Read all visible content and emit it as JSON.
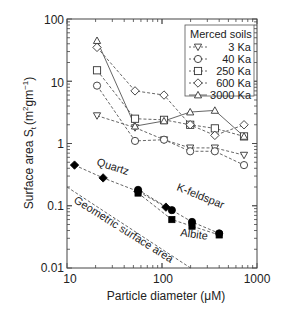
{
  "chart_data": {
    "type": "scatter",
    "title": "",
    "xlabel": "Particle diameter (μM)",
    "ylabel": "Surface area S_t (m²gm⁻¹)",
    "xscale": "log",
    "yscale": "log",
    "xlim": [
      10,
      1000
    ],
    "ylim": [
      0.01,
      100
    ],
    "xticks": [
      "10",
      "100",
      "1000"
    ],
    "yticks": [
      "0.01",
      "0.1",
      "1",
      "10",
      "100"
    ],
    "grid": false,
    "legend": {
      "title": "Merced soils",
      "position": "upper right",
      "entries": [
        "3 Ka",
        "40 Ka",
        "250 Ka",
        "600 Ka",
        "3000 Ka"
      ]
    },
    "series": [
      {
        "name": "3 Ka",
        "marker": "triangle-down",
        "line": "dashed",
        "x": [
          20.7,
          52,
          105,
          198,
          360,
          730
        ],
        "y": [
          2.8,
          1.8,
          1.15,
          0.85,
          0.85,
          0.65
        ]
      },
      {
        "name": "40 Ka",
        "marker": "circle",
        "line": "dashed",
        "x": [
          20.7,
          52,
          105,
          198,
          360,
          730
        ],
        "y": [
          8.5,
          1.1,
          1.15,
          0.75,
          0.75,
          0.45
        ]
      },
      {
        "name": "250 Ka",
        "marker": "square",
        "line": "dashed",
        "x": [
          20.7,
          52,
          105,
          198,
          360,
          730
        ],
        "y": [
          15,
          2.5,
          2.4,
          2.0,
          1.75,
          1.3
        ]
      },
      {
        "name": "600 Ka",
        "marker": "diamond",
        "line": "dashed",
        "x": [
          20.7,
          52,
          105,
          198,
          360,
          730
        ],
        "y": [
          35,
          7.0,
          6.0,
          2.0,
          1.35,
          2.0
        ]
      },
      {
        "name": "3000 Ka",
        "marker": "triangle-up",
        "line": "solid",
        "x": [
          20.7,
          52,
          105,
          198,
          360,
          730
        ],
        "y": [
          45,
          1.9,
          2.3,
          3.2,
          3.4,
          1.3
        ]
      },
      {
        "name": "Quartz",
        "marker": "filled-diamond",
        "line": "dashed",
        "x": [
          12,
          24,
          56,
          110
        ],
        "y": [
          0.45,
          0.28,
          0.17,
          0.095
        ]
      },
      {
        "name": "K-feldspar",
        "marker": "filled-circle",
        "line": "dashed",
        "x": [
          56,
          127,
          207,
          400
        ],
        "y": [
          0.18,
          0.085,
          0.055,
          0.036
        ]
      },
      {
        "name": "Albite",
        "marker": "filled-square",
        "line": "dashed",
        "x": [
          56,
          127,
          207,
          400
        ],
        "y": [
          0.16,
          0.06,
          0.047,
          0.034
        ]
      },
      {
        "name": "Geometric surface area",
        "marker": "none",
        "line": "dashed",
        "x": [
          10,
          200
        ],
        "y": [
          0.2,
          0.01
        ]
      }
    ],
    "annotations": [
      "Quartz",
      "K-feldspar",
      "Albite",
      "Geometric surface area"
    ]
  },
  "labels": {
    "xlabel": "Particle diameter (μM)",
    "ylabel_main": "Surface area S",
    "ylabel_sub": "t",
    "ylabel_unit": "(m",
    "ylabel_sup2": "2",
    "ylabel_gm": "gm",
    "ylabel_supm1": "−1",
    "ylabel_close": ")",
    "legend_title": "Merced soils",
    "legend_3": "3 Ka",
    "legend_40": "40 Ka",
    "legend_250": "250 Ka",
    "legend_600": "600 Ka",
    "legend_3000": "3000 Ka",
    "quartz": "Quartz",
    "kfeldspar": "K-feldspar",
    "albite": "Albite",
    "geometric": "Geometric surface area",
    "xt10": "10",
    "xt100": "100",
    "xt1000": "1000",
    "yt001": "0.01",
    "yt01": "0.1",
    "yt1": "1",
    "yt10": "10",
    "yt100": "100"
  }
}
